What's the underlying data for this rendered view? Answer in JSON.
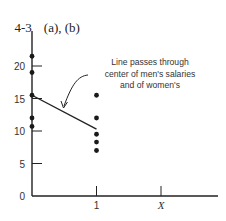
{
  "heading": {
    "number": "4-3",
    "parts": "(a), (b)"
  },
  "chart_data": {
    "type": "scatter",
    "xlabel": "",
    "ylabel": "",
    "x_ticks": [
      {
        "value": 1,
        "label": "1"
      },
      {
        "value": 2,
        "label": "X"
      }
    ],
    "y_ticks": [
      {
        "value": 0,
        "label": "0"
      },
      {
        "value": 5,
        "label": "5"
      },
      {
        "value": 10,
        "label": "10"
      },
      {
        "value": 15,
        "label": "15"
      },
      {
        "value": 20,
        "label": "20"
      }
    ],
    "ylim": [
      0,
      25
    ],
    "xlim": [
      0,
      3
    ],
    "grid": false,
    "series": [
      {
        "name": "men's salaries (X=0)",
        "x": [
          0,
          0,
          0,
          0,
          0
        ],
        "y": [
          21.5,
          19,
          15.5,
          12,
          10.7
        ]
      },
      {
        "name": "women's salaries (X=1)",
        "x": [
          1,
          1,
          1,
          1,
          1
        ],
        "y": [
          15.5,
          12,
          9.5,
          8.3,
          7
        ]
      },
      {
        "name": "fitted line",
        "type": "line",
        "x": [
          0,
          1
        ],
        "y": [
          15.5,
          10.3
        ]
      }
    ],
    "annotations": [
      {
        "lines": [
          "Line passes through",
          "center of men's salaries",
          "and of women's"
        ],
        "points_to": "fitted line"
      }
    ]
  }
}
